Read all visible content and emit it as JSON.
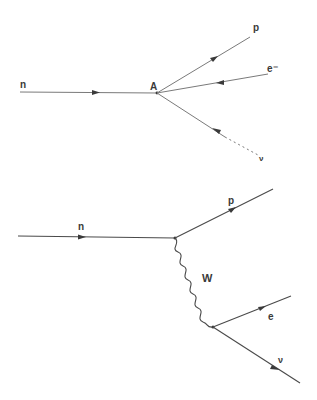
{
  "figure": {
    "upper_diagram": {
      "title": "Four-fermion point interaction",
      "vertex_label": "A",
      "incoming": {
        "label": "n"
      },
      "outgoing": [
        {
          "label": "p"
        },
        {
          "label": "e⁻"
        },
        {
          "label": "ν"
        }
      ]
    },
    "lower_diagram": {
      "title": "W boson exchange",
      "incoming": {
        "label": "n"
      },
      "outgoing_top": {
        "label": "p"
      },
      "propagator": {
        "label": "W",
        "style": "wavy"
      },
      "outgoing_bottom": [
        {
          "label": "e"
        },
        {
          "label": "ν"
        }
      ]
    },
    "colors": {
      "line": "#4a4a4a",
      "text": "#3a3a3a",
      "background": "#ffffff"
    }
  }
}
